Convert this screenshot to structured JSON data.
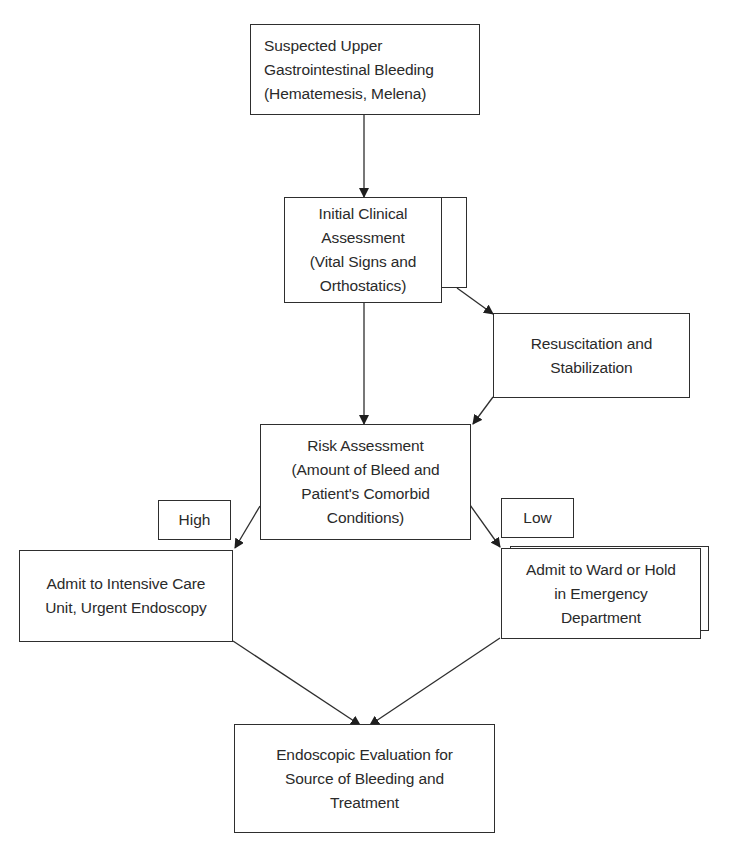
{
  "flowchart": {
    "nodes": {
      "suspected": {
        "lines": [
          "Suspected Upper",
          "Gastrointestinal Bleeding",
          "(Hematemesis, Melena)"
        ]
      },
      "initial": {
        "lines": [
          "Initial Clinical",
          "Assessment",
          "(Vital Signs and",
          "Orthostatics)"
        ]
      },
      "resuscitation": {
        "lines": [
          "Resuscitation and",
          "Stabilization"
        ]
      },
      "risk": {
        "lines": [
          "Risk Assessment",
          "(Amount of Bleed and",
          "Patient's Comorbid",
          "Conditions)"
        ]
      },
      "icu": {
        "lines": [
          "Admit to Intensive Care",
          "Unit, Urgent Endoscopy"
        ]
      },
      "ward": {
        "lines": [
          "Admit to Ward or Hold",
          "in Emergency",
          "Department"
        ]
      },
      "endoscopic": {
        "lines": [
          "Endoscopic Evaluation for",
          "Source of Bleeding and",
          "Treatment"
        ]
      }
    },
    "branch_labels": {
      "high": "High",
      "low": "Low"
    },
    "edges": [
      {
        "from": "suspected",
        "to": "initial"
      },
      {
        "from": "initial",
        "to": "resuscitation"
      },
      {
        "from": "initial",
        "to": "risk"
      },
      {
        "from": "resuscitation",
        "to": "risk"
      },
      {
        "from": "risk",
        "to": "icu",
        "label": "High"
      },
      {
        "from": "risk",
        "to": "ward",
        "label": "Low"
      },
      {
        "from": "icu",
        "to": "endoscopic"
      },
      {
        "from": "ward",
        "to": "endoscopic"
      }
    ]
  },
  "colors": {
    "line": "#2e2e2e",
    "background": "#ffffff",
    "text": "#2a2a2a"
  }
}
